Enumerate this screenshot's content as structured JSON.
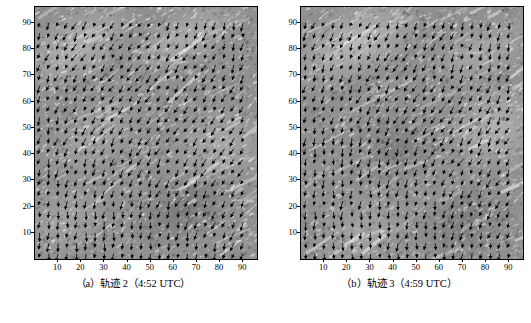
{
  "figure": {
    "panels": [
      {
        "id": "panel-a",
        "caption": "（a）轨迹 2（4:52 UTC）",
        "label": "a",
        "title": "轨迹 2",
        "time": "4:52 UTC"
      },
      {
        "id": "panel-b",
        "caption": "（b）轨迹 3（4:59 UTC）",
        "label": "b",
        "title": "轨迹 3",
        "time": "4:59 UTC"
      }
    ]
  },
  "chart_data": {
    "type": "scatter",
    "subtype": "quiver-vector-field-over-grayscale-image",
    "title": "",
    "xlabel": "",
    "ylabel": "",
    "xlim": [
      0,
      96
    ],
    "ylim": [
      0,
      96
    ],
    "grid": false,
    "legend": null,
    "x_ticks": [
      10,
      20,
      30,
      40,
      50,
      60,
      70,
      80,
      90
    ],
    "y_ticks": [
      10,
      20,
      30,
      40,
      50,
      60,
      70,
      80,
      90
    ],
    "x_tick_labels": [
      "10",
      "20",
      "30",
      "40",
      "50",
      "60",
      "70",
      "80",
      "90"
    ],
    "y_tick_labels": [
      "10",
      "20",
      "30",
      "40",
      "50",
      "60",
      "70",
      "80",
      "90"
    ],
    "panels": [
      {
        "name": "轨迹 2（4:52 UTC）",
        "vector_grid_spacing": 4,
        "vector_count_x": 23,
        "vector_count_y": 23,
        "dominant_direction_deg": 250,
        "background": "grayscale speckle texture, bright diagonal streaks from lower-left to upper-right"
      },
      {
        "name": "轨迹 3（4:59 UTC）",
        "vector_grid_spacing": 4,
        "vector_count_x": 23,
        "vector_count_y": 23,
        "dominant_direction_deg": 255,
        "background": "grayscale speckle texture, bright patch near upper-left and right-centre"
      }
    ]
  }
}
